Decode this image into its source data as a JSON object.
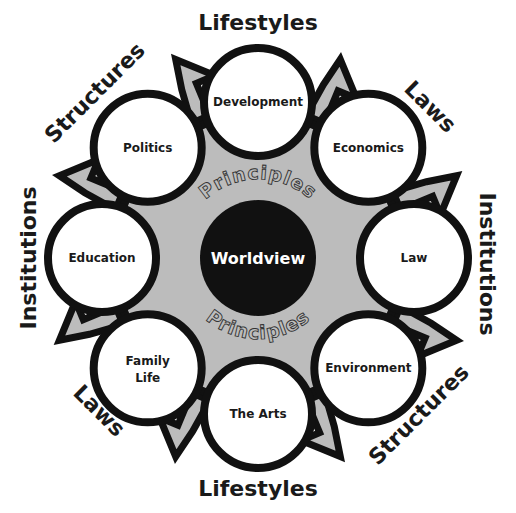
{
  "diagram": {
    "center": {
      "label": "Worldview",
      "fill": "#111111"
    },
    "ring_label_top": "Principles",
    "ring_label_bottom": "Principles",
    "nodes": [
      {
        "label": "Development",
        "angle": -90
      },
      {
        "label": "Economics",
        "angle": -45
      },
      {
        "label": "Law",
        "angle": 0
      },
      {
        "label": "Environment",
        "angle": 45
      },
      {
        "label": "The Arts",
        "angle": 90
      },
      {
        "label": "Family",
        "label2": "Life",
        "angle": 135
      },
      {
        "label": "Education",
        "angle": 180
      },
      {
        "label": "Politics",
        "angle": -135
      }
    ],
    "outer_labels": [
      {
        "label": "Lifestyles",
        "position": "top"
      },
      {
        "label": "Laws",
        "position": "top-right"
      },
      {
        "label": "Institutions",
        "position": "right"
      },
      {
        "label": "Structures",
        "position": "bottom-right"
      },
      {
        "label": "Lifestyles",
        "position": "bottom"
      },
      {
        "label": "Laws",
        "position": "bottom-left"
      },
      {
        "label": "Institutions",
        "position": "left"
      },
      {
        "label": "Structures",
        "position": "top-left"
      }
    ],
    "colors": {
      "stroke": "#111111",
      "gray_fill": "#bcbcbc",
      "node_fill": "#ffffff",
      "background": "#ffffff"
    }
  }
}
